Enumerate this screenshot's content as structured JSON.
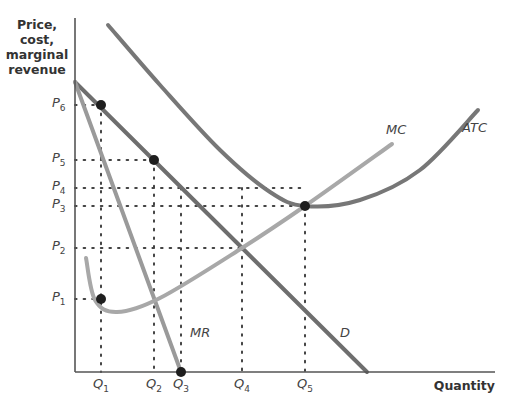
{
  "chart_data": {
    "type": "line",
    "title": "",
    "xlabel": "Quantity",
    "ylabel": "Price, cost, marginal revenue",
    "ylabel_lines": [
      "Price,",
      "cost,",
      "marginal",
      "revenue"
    ],
    "grid": false,
    "legend": "none (curves labeled inline)",
    "y_ticks": [
      {
        "label": "P",
        "sub": "6",
        "y": 105
      },
      {
        "label": "P",
        "sub": "5",
        "y": 160
      },
      {
        "label": "P",
        "sub": "4",
        "y": 188
      },
      {
        "label": "P",
        "sub": "3",
        "y": 206
      },
      {
        "label": "P",
        "sub": "2",
        "y": 248
      },
      {
        "label": "P",
        "sub": "1",
        "y": 299
      }
    ],
    "x_ticks": [
      {
        "label": "Q",
        "sub": "1",
        "x": 101
      },
      {
        "label": "Q",
        "sub": "2",
        "x": 154
      },
      {
        "label": "Q",
        "sub": "3",
        "x": 181
      },
      {
        "label": "Q",
        "sub": "4",
        "x": 242
      },
      {
        "label": "Q",
        "sub": "5",
        "x": 305
      }
    ],
    "series": [
      {
        "name": "D",
        "description": "Demand (downward-sloping straight line)",
        "color": "#6e6e6e",
        "points": [
          [
            75,
            82
          ],
          [
            367,
            372
          ]
        ]
      },
      {
        "name": "MR",
        "description": "Marginal revenue (steeper line)",
        "color": "#9a9a9a",
        "points": [
          [
            75,
            82
          ],
          [
            181,
            372
          ]
        ]
      },
      {
        "name": "ATC",
        "description": "Average total cost (U-shaped, min at Q5,P3)",
        "color": "#777777",
        "points": [
          [
            108,
            25
          ],
          [
            160,
            85
          ],
          [
            220,
            150
          ],
          [
            270,
            192
          ],
          [
            305,
            206
          ],
          [
            360,
            200
          ],
          [
            420,
            170
          ],
          [
            478,
            110
          ]
        ]
      },
      {
        "name": "MC",
        "description": "Marginal cost (dips then rises through ATC minimum)",
        "color": "#a8a8a8",
        "points": [
          [
            86,
            258
          ],
          [
            95,
            300
          ],
          [
            117,
            312
          ],
          [
            160,
            298
          ],
          [
            242,
            248
          ],
          [
            305,
            206
          ],
          [
            392,
            144
          ]
        ]
      }
    ],
    "marked_points": [
      {
        "label": "P6 on D at Q1",
        "x": 101,
        "y": 105
      },
      {
        "label": "P5 on D at Q2",
        "x": 154,
        "y": 160
      },
      {
        "label": "MC/ATC min at Q5, P3",
        "x": 305,
        "y": 206
      },
      {
        "label": "P1 on MC at Q1",
        "x": 101,
        "y": 299
      },
      {
        "label": "MR = 0 at Q3",
        "x": 181,
        "y": 372
      }
    ],
    "dotted_guides": [
      {
        "from": [
          75,
          105
        ],
        "to": [
          101,
          105
        ]
      },
      {
        "from": [
          75,
          160
        ],
        "to": [
          154,
          160
        ]
      },
      {
        "from": [
          75,
          188
        ],
        "to": [
          305,
          188
        ]
      },
      {
        "from": [
          75,
          206
        ],
        "to": [
          305,
          206
        ]
      },
      {
        "from": [
          75,
          248
        ],
        "to": [
          242,
          248
        ]
      },
      {
        "from": [
          75,
          299
        ],
        "to": [
          101,
          299
        ]
      },
      {
        "from": [
          101,
          105
        ],
        "to": [
          101,
          372
        ]
      },
      {
        "from": [
          154,
          160
        ],
        "to": [
          154,
          372
        ]
      },
      {
        "from": [
          181,
          188
        ],
        "to": [
          181,
          372
        ]
      },
      {
        "from": [
          242,
          188
        ],
        "to": [
          242,
          372
        ]
      },
      {
        "from": [
          305,
          206
        ],
        "to": [
          305,
          372
        ]
      }
    ],
    "curve_labels": [
      {
        "text": "MC",
        "x": 386,
        "y": 136
      },
      {
        "text": "ATC",
        "x": 462,
        "y": 134
      },
      {
        "text": "MR",
        "x": 190,
        "y": 339
      },
      {
        "text": "D",
        "x": 340,
        "y": 339
      }
    ]
  }
}
